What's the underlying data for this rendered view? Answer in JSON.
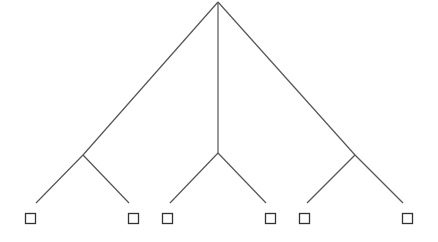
{
  "diagram": {
    "type": "tree",
    "background_text_faded": true,
    "colors": {
      "edge": "#555555",
      "leaf_border": "#333333",
      "background": "#ffffff"
    },
    "root": {
      "id": "root",
      "x": 218,
      "y": 2
    },
    "internal_nodes": [
      {
        "id": "left",
        "x": 83,
        "y": 155
      },
      {
        "id": "middle",
        "x": 218,
        "y": 153
      },
      {
        "id": "right",
        "x": 355,
        "y": 155
      }
    ],
    "edges": [
      {
        "from": [
          218,
          2
        ],
        "to": [
          83,
          155
        ]
      },
      {
        "from": [
          218,
          2
        ],
        "to": [
          218,
          153
        ]
      },
      {
        "from": [
          218,
          2
        ],
        "to": [
          355,
          155
        ]
      },
      {
        "from": [
          83,
          155
        ],
        "to": [
          36,
          203
        ]
      },
      {
        "from": [
          83,
          155
        ],
        "to": [
          129,
          203
        ]
      },
      {
        "from": [
          218,
          153
        ],
        "to": [
          170,
          203
        ]
      },
      {
        "from": [
          218,
          153
        ],
        "to": [
          266,
          203
        ]
      },
      {
        "from": [
          355,
          155
        ],
        "to": [
          307,
          203
        ]
      },
      {
        "from": [
          355,
          155
        ],
        "to": [
          403,
          203
        ]
      }
    ],
    "leaves": [
      {
        "x": 25,
        "y": 213,
        "size": 11
      },
      {
        "x": 128,
        "y": 213,
        "size": 11
      },
      {
        "x": 162,
        "y": 213,
        "size": 11
      },
      {
        "x": 265,
        "y": 213,
        "size": 11
      },
      {
        "x": 299,
        "y": 213,
        "size": 11
      },
      {
        "x": 402,
        "y": 213,
        "size": 11
      }
    ]
  }
}
